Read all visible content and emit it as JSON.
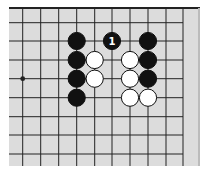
{
  "diagram": {
    "type": "go-board-fragment",
    "colors": {
      "board": "#dcdcdc",
      "line": "#222222",
      "black": "#111111",
      "white": "#ffffff",
      "label_on_black": "#ffffff"
    },
    "grid": {
      "xs": [
        22.7,
        40.7,
        58.7,
        76.7,
        94.7,
        112,
        130,
        148,
        166,
        183
      ],
      "ys": [
        22.7,
        41,
        60,
        78.7,
        97.7,
        116.7,
        135,
        154
      ]
    },
    "hoshi": [
      {
        "col": 0,
        "row": 3
      }
    ],
    "stones": [
      {
        "color": "black",
        "col": 3,
        "row": 1,
        "label": ""
      },
      {
        "color": "black",
        "col": 3,
        "row": 2,
        "label": ""
      },
      {
        "color": "black",
        "col": 3,
        "row": 3,
        "label": ""
      },
      {
        "color": "black",
        "col": 3,
        "row": 4,
        "label": ""
      },
      {
        "color": "white",
        "col": 4,
        "row": 2,
        "label": ""
      },
      {
        "color": "white",
        "col": 4,
        "row": 3,
        "label": ""
      },
      {
        "color": "black",
        "col": 5,
        "row": 1,
        "label": "1"
      },
      {
        "color": "white",
        "col": 6,
        "row": 2,
        "label": ""
      },
      {
        "color": "white",
        "col": 6,
        "row": 3,
        "label": ""
      },
      {
        "color": "white",
        "col": 6,
        "row": 4,
        "label": ""
      },
      {
        "color": "white",
        "col": 7,
        "row": 4,
        "label": ""
      },
      {
        "color": "black",
        "col": 7,
        "row": 1,
        "label": ""
      },
      {
        "color": "black",
        "col": 7,
        "row": 2,
        "label": ""
      },
      {
        "color": "black",
        "col": 7,
        "row": 3,
        "label": ""
      }
    ]
  }
}
